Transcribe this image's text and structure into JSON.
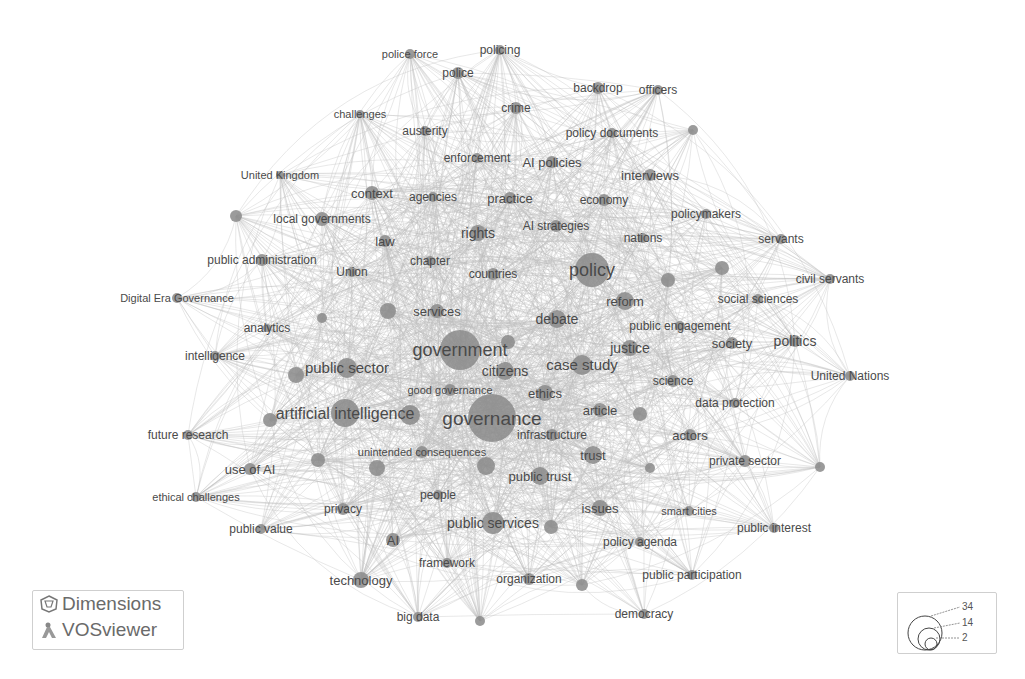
{
  "chart_data": {
    "type": "network",
    "title": "",
    "size_legend": {
      "values": [
        34,
        14,
        2
      ]
    },
    "nodes": [
      {
        "label": "policing",
        "x": 500,
        "y": 50,
        "r": 5,
        "fs": 12
      },
      {
        "label": "police force",
        "x": 410,
        "y": 54,
        "r": 5,
        "fs": 11
      },
      {
        "label": "police",
        "x": 458,
        "y": 73,
        "r": 6,
        "fs": 12
      },
      {
        "label": "backdrop",
        "x": 598,
        "y": 88,
        "r": 6,
        "fs": 12
      },
      {
        "label": "officers",
        "x": 658,
        "y": 90,
        "r": 5,
        "fs": 12
      },
      {
        "label": "crime",
        "x": 516,
        "y": 108,
        "r": 6,
        "fs": 12
      },
      {
        "label": "challenges",
        "x": 360,
        "y": 114,
        "r": 4,
        "fs": 11
      },
      {
        "label": "austerity",
        "x": 425,
        "y": 131,
        "r": 5,
        "fs": 12
      },
      {
        "label": "policy documents",
        "x": 612,
        "y": 133,
        "r": 5,
        "fs": 12
      },
      {
        "label": "",
        "x": 693,
        "y": 130,
        "r": 5,
        "fs": 11
      },
      {
        "label": "enforcement",
        "x": 477,
        "y": 158,
        "r": 5,
        "fs": 12
      },
      {
        "label": "AI policies",
        "x": 552,
        "y": 162,
        "r": 6,
        "fs": 13
      },
      {
        "label": "United Kingdom",
        "x": 280,
        "y": 175,
        "r": 4,
        "fs": 11
      },
      {
        "label": "interviews",
        "x": 650,
        "y": 175,
        "r": 6,
        "fs": 13
      },
      {
        "label": "context",
        "x": 372,
        "y": 193,
        "r": 7,
        "fs": 13
      },
      {
        "label": "agencies",
        "x": 433,
        "y": 197,
        "r": 5,
        "fs": 12
      },
      {
        "label": "practice",
        "x": 510,
        "y": 198,
        "r": 6,
        "fs": 13
      },
      {
        "label": "economy",
        "x": 604,
        "y": 200,
        "r": 6,
        "fs": 12
      },
      {
        "label": "",
        "x": 236,
        "y": 216,
        "r": 6,
        "fs": 11
      },
      {
        "label": "local governments",
        "x": 322,
        "y": 219,
        "r": 7,
        "fs": 12
      },
      {
        "label": "policymakers",
        "x": 706,
        "y": 214,
        "r": 5,
        "fs": 12
      },
      {
        "label": "AI strategies",
        "x": 556,
        "y": 226,
        "r": 6,
        "fs": 12
      },
      {
        "label": "rights",
        "x": 478,
        "y": 233,
        "r": 8,
        "fs": 14
      },
      {
        "label": "nations",
        "x": 643,
        "y": 238,
        "r": 5,
        "fs": 12
      },
      {
        "label": "servants",
        "x": 781,
        "y": 239,
        "r": 5,
        "fs": 12
      },
      {
        "label": "law",
        "x": 385,
        "y": 241,
        "r": 6,
        "fs": 13
      },
      {
        "label": "public administration",
        "x": 262,
        "y": 260,
        "r": 6,
        "fs": 12
      },
      {
        "label": "chapter",
        "x": 430,
        "y": 261,
        "r": 5,
        "fs": 12
      },
      {
        "label": "Union",
        "x": 352,
        "y": 272,
        "r": 5,
        "fs": 12
      },
      {
        "label": "countries",
        "x": 493,
        "y": 274,
        "r": 6,
        "fs": 12
      },
      {
        "label": "policy",
        "x": 592,
        "y": 270,
        "r": 17,
        "fs": 18
      },
      {
        "label": "",
        "x": 668,
        "y": 280,
        "r": 7,
        "fs": 11
      },
      {
        "label": "",
        "x": 722,
        "y": 268,
        "r": 7,
        "fs": 11
      },
      {
        "label": "civil servants",
        "x": 830,
        "y": 279,
        "r": 5,
        "fs": 12
      },
      {
        "label": "Digital Era Governance",
        "x": 177,
        "y": 298,
        "r": 5,
        "fs": 11
      },
      {
        "label": "reform",
        "x": 625,
        "y": 301,
        "r": 9,
        "fs": 13
      },
      {
        "label": "social sciences",
        "x": 758,
        "y": 299,
        "r": 5,
        "fs": 12
      },
      {
        "label": "services",
        "x": 437,
        "y": 311,
        "r": 7,
        "fs": 13
      },
      {
        "label": "",
        "x": 388,
        "y": 311,
        "r": 8,
        "fs": 11
      },
      {
        "label": "debate",
        "x": 557,
        "y": 319,
        "r": 9,
        "fs": 14
      },
      {
        "label": "analytics",
        "x": 267,
        "y": 328,
        "r": 4,
        "fs": 12
      },
      {
        "label": "",
        "x": 322,
        "y": 318,
        "r": 5,
        "fs": 11
      },
      {
        "label": "public engagement",
        "x": 680,
        "y": 326,
        "r": 5,
        "fs": 12
      },
      {
        "label": "government",
        "x": 460,
        "y": 350,
        "r": 20,
        "fs": 18
      },
      {
        "label": "",
        "x": 508,
        "y": 342,
        "r": 7,
        "fs": 11
      },
      {
        "label": "justice",
        "x": 630,
        "y": 348,
        "r": 8,
        "fs": 14
      },
      {
        "label": "society",
        "x": 732,
        "y": 343,
        "r": 6,
        "fs": 13
      },
      {
        "label": "politics",
        "x": 795,
        "y": 341,
        "r": 6,
        "fs": 14
      },
      {
        "label": "intelligence",
        "x": 215,
        "y": 356,
        "r": 5,
        "fs": 12
      },
      {
        "label": "public sector",
        "x": 347,
        "y": 368,
        "r": 10,
        "fs": 15
      },
      {
        "label": "",
        "x": 296,
        "y": 375,
        "r": 8,
        "fs": 11
      },
      {
        "label": "citizens",
        "x": 505,
        "y": 371,
        "r": 9,
        "fs": 14
      },
      {
        "label": "case study",
        "x": 582,
        "y": 365,
        "r": 10,
        "fs": 15
      },
      {
        "label": "United Nations",
        "x": 850,
        "y": 376,
        "r": 5,
        "fs": 12
      },
      {
        "label": "good governance",
        "x": 450,
        "y": 390,
        "r": 6,
        "fs": 11
      },
      {
        "label": "ethics",
        "x": 545,
        "y": 393,
        "r": 8,
        "fs": 13
      },
      {
        "label": "science",
        "x": 673,
        "y": 381,
        "r": 6,
        "fs": 12
      },
      {
        "label": "data protection",
        "x": 735,
        "y": 403,
        "r": 5,
        "fs": 12
      },
      {
        "label": "artificial intelligence",
        "x": 345,
        "y": 413,
        "r": 14,
        "fs": 16
      },
      {
        "label": "",
        "x": 410,
        "y": 415,
        "r": 10,
        "fs": 11
      },
      {
        "label": "governance",
        "x": 492,
        "y": 418,
        "r": 24,
        "fs": 19
      },
      {
        "label": "article",
        "x": 600,
        "y": 410,
        "r": 7,
        "fs": 13
      },
      {
        "label": "",
        "x": 640,
        "y": 414,
        "r": 7,
        "fs": 11
      },
      {
        "label": "",
        "x": 270,
        "y": 420,
        "r": 7,
        "fs": 11
      },
      {
        "label": "future research",
        "x": 188,
        "y": 435,
        "r": 5,
        "fs": 12
      },
      {
        "label": "infrastructure",
        "x": 552,
        "y": 435,
        "r": 6,
        "fs": 12
      },
      {
        "label": "actors",
        "x": 690,
        "y": 435,
        "r": 6,
        "fs": 13
      },
      {
        "label": "unintended consequences",
        "x": 422,
        "y": 452,
        "r": 6,
        "fs": 11
      },
      {
        "label": "trust",
        "x": 593,
        "y": 455,
        "r": 9,
        "fs": 13
      },
      {
        "label": "",
        "x": 318,
        "y": 460,
        "r": 7,
        "fs": 11
      },
      {
        "label": "",
        "x": 377,
        "y": 468,
        "r": 8,
        "fs": 11
      },
      {
        "label": "use of AI",
        "x": 250,
        "y": 469,
        "r": 6,
        "fs": 13
      },
      {
        "label": "public trust",
        "x": 540,
        "y": 476,
        "r": 9,
        "fs": 13
      },
      {
        "label": "",
        "x": 486,
        "y": 466,
        "r": 9,
        "fs": 11
      },
      {
        "label": "",
        "x": 650,
        "y": 468,
        "r": 5,
        "fs": 11
      },
      {
        "label": "private sector",
        "x": 745,
        "y": 461,
        "r": 6,
        "fs": 12
      },
      {
        "label": "",
        "x": 820,
        "y": 467,
        "r": 5,
        "fs": 11
      },
      {
        "label": "ethical challenges",
        "x": 196,
        "y": 497,
        "r": 5,
        "fs": 11
      },
      {
        "label": "people",
        "x": 438,
        "y": 495,
        "r": 5,
        "fs": 12
      },
      {
        "label": "privacy",
        "x": 343,
        "y": 509,
        "r": 6,
        "fs": 12
      },
      {
        "label": "issues",
        "x": 600,
        "y": 508,
        "r": 8,
        "fs": 13
      },
      {
        "label": "smart cities",
        "x": 689,
        "y": 511,
        "r": 5,
        "fs": 11
      },
      {
        "label": "public services",
        "x": 493,
        "y": 523,
        "r": 11,
        "fs": 14
      },
      {
        "label": "",
        "x": 551,
        "y": 527,
        "r": 7,
        "fs": 11
      },
      {
        "label": "public interest",
        "x": 774,
        "y": 528,
        "r": 5,
        "fs": 12
      },
      {
        "label": "public value",
        "x": 261,
        "y": 529,
        "r": 5,
        "fs": 12
      },
      {
        "label": "AI",
        "x": 393,
        "y": 540,
        "r": 7,
        "fs": 13
      },
      {
        "label": "policy agenda",
        "x": 640,
        "y": 542,
        "r": 5,
        "fs": 12
      },
      {
        "label": "framework",
        "x": 447,
        "y": 563,
        "r": 5,
        "fs": 12
      },
      {
        "label": "technology",
        "x": 361,
        "y": 580,
        "r": 8,
        "fs": 13
      },
      {
        "label": "organization",
        "x": 529,
        "y": 579,
        "r": 6,
        "fs": 12
      },
      {
        "label": "",
        "x": 582,
        "y": 585,
        "r": 6,
        "fs": 11
      },
      {
        "label": "public participation",
        "x": 692,
        "y": 575,
        "r": 5,
        "fs": 12
      },
      {
        "label": "big data",
        "x": 418,
        "y": 617,
        "r": 5,
        "fs": 12
      },
      {
        "label": "",
        "x": 480,
        "y": 621,
        "r": 5,
        "fs": 11
      },
      {
        "label": "democracy",
        "x": 644,
        "y": 614,
        "r": 5,
        "fs": 12
      }
    ]
  },
  "branding": {
    "dimensions": "Dimensions",
    "vosviewer": "VOSviewer"
  },
  "legend": {
    "max": "34",
    "mid": "14",
    "min": "2"
  },
  "colors": {
    "node": "#8a8a8a",
    "edge": "#bdbdbd",
    "label": "#4a4a4a"
  }
}
